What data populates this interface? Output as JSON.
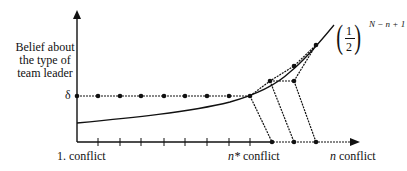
{
  "diagram": {
    "y_axis_label": [
      "Belief about",
      "the type of",
      "team leader"
    ],
    "delta_label": "δ",
    "x_axis_labels": {
      "first": "1. conflict",
      "nstar_var": "n*",
      "nstar_text": " conflict",
      "n_var": "n",
      "n_text": " conflict"
    },
    "curve_formula": {
      "numerator": "1",
      "denominator": "2",
      "exponent": "N − n + 1"
    },
    "colors": {
      "line": "#111111",
      "background": "#ffffff"
    },
    "elements": {
      "delta_level_points": 9,
      "x_axis_ticks": 8,
      "axis_points_after_nstar": 3,
      "curve_points": 3
    }
  }
}
